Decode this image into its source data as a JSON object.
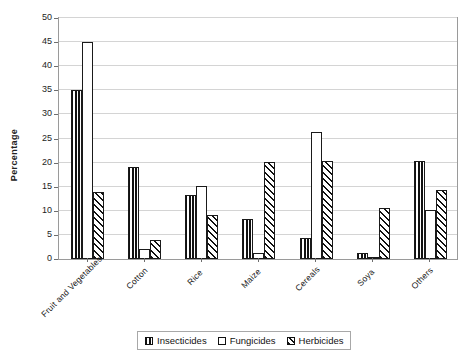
{
  "chart_data": {
    "type": "bar",
    "title": "",
    "xlabel": "",
    "ylabel": "Percentage",
    "ylim": [
      0,
      50
    ],
    "ytick_step": 5,
    "yticks": [
      0,
      5,
      10,
      15,
      20,
      25,
      30,
      35,
      40,
      45,
      50
    ],
    "grid": true,
    "legend_position": "bottom",
    "categories": [
      "Fruit and Vegetables",
      "Cotton",
      "Rice",
      "Maize",
      "Cereals",
      "Soya",
      "Others"
    ],
    "series": [
      {
        "name": "Insecticides",
        "pattern": "vertical-lines",
        "values": [
          35,
          19,
          13.2,
          8.3,
          4.3,
          1.3,
          20.3
        ]
      },
      {
        "name": "Fungicides",
        "pattern": "dots",
        "values": [
          45,
          2.1,
          15.2,
          1.2,
          26.3,
          0.5,
          10.2
        ]
      },
      {
        "name": "Herbicides",
        "pattern": "diagonal-hatch",
        "values": [
          14,
          4,
          9.1,
          20.2,
          20.3,
          10.5,
          14.3
        ]
      }
    ]
  },
  "colors": {
    "axis": "#9a9a9a",
    "gridline": "#d4d4d4",
    "bar_outline": "#1a1a1a",
    "text": "#171717",
    "background": "#ffffff"
  },
  "legend": {
    "items": [
      "Insecticides",
      "Fungicides",
      "Herbicides"
    ]
  }
}
